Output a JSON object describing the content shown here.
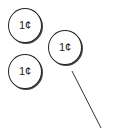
{
  "diagram": {
    "coins": [
      {
        "label": "1¢",
        "cx": 25,
        "cy": 25,
        "r": 17
      },
      {
        "label": "1¢",
        "cx": 65,
        "cy": 47,
        "r": 17
      },
      {
        "label": "1¢",
        "cx": 25,
        "cy": 71,
        "r": 17
      }
    ],
    "pointer_line": {
      "x1": 72,
      "y1": 71,
      "x2": 101,
      "y2": 128
    },
    "colors": {
      "stroke": "#222222",
      "background": "#ffffff"
    }
  }
}
